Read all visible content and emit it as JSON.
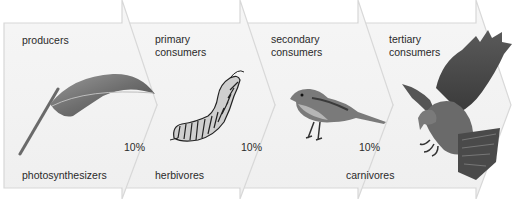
{
  "diagram": {
    "type": "energy-pyramid-flow",
    "stages": [
      {
        "id": "producers",
        "title_line1": "producers",
        "title_line2": "",
        "role": "photosynthesizers",
        "organism": "leaf-icon"
      },
      {
        "id": "primary",
        "title_line1": "primary",
        "title_line2": "consumers",
        "role": "herbivores",
        "organism": "caterpillar-icon"
      },
      {
        "id": "secondary",
        "title_line1": "secondary",
        "title_line2": "consumers",
        "role": "",
        "organism": "sparrow-icon"
      },
      {
        "id": "tertiary",
        "title_line1": "tertiary",
        "title_line2": "consumers",
        "role": "",
        "organism": "hawk-icon"
      }
    ],
    "transfers": [
      {
        "from": "producers",
        "to": "primary",
        "label": "10%"
      },
      {
        "from": "primary",
        "to": "secondary",
        "label": "10%"
      },
      {
        "from": "secondary",
        "to": "tertiary",
        "label": "10%"
      }
    ],
    "shared_role_label": "carnivores",
    "colors": {
      "arrow_fill": "#f3f3f3",
      "arrow_stroke": "#d6d6d6",
      "text": "#2a2a2a"
    }
  }
}
